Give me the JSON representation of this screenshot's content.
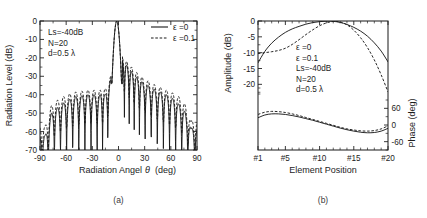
{
  "figure": {
    "background": "#ffffff",
    "ink_color": "#1b1b1b"
  },
  "captions": {
    "left": "(a)",
    "right": "(b)"
  },
  "chart_data": [
    {
      "id": "radiation-pattern",
      "type": "line",
      "title": "",
      "caption": "(a)",
      "xlabel_parts": {
        "main": "Radiation Angel",
        "symbol": "θ",
        "unit": "(deg)"
      },
      "xlabel": "Radiation Angel θ (deg)",
      "ylabel": "Radiation Level (dB)",
      "xlim": [
        -90,
        90
      ],
      "ylim": [
        -70,
        0
      ],
      "xticks": [
        -90,
        -60,
        -30,
        0,
        30,
        60,
        90
      ],
      "xtick_labels": [
        "-90",
        "-60",
        "-30",
        "0",
        "30",
        "60",
        "90"
      ],
      "yticks": [
        0,
        -10,
        -20,
        -30,
        -40,
        -50,
        -60,
        -70
      ],
      "ytick_labels": [
        "0",
        "-10",
        "-20",
        "-30",
        "-40",
        "-50",
        "-60",
        "-70"
      ],
      "grid": false,
      "annotations": [
        "Ls=-40dB",
        "N=20",
        "d=0.5 λ"
      ],
      "legend_position": "top-right",
      "legend": [
        {
          "label": "ε =0",
          "style": "solid"
        },
        {
          "label": "ε =0.1",
          "style": "dashed"
        }
      ],
      "series": [
        {
          "name": "ε =0",
          "style": "solid",
          "comment": "sidelobe envelope values at lobe peaks, nulls reach floor",
          "peaks_x": [
            -84,
            -77,
            -70,
            -63,
            -56,
            -49,
            -42,
            -35,
            -28,
            -21,
            -15.5,
            -9,
            4,
            9.5,
            15,
            21,
            27,
            34,
            41,
            48,
            55,
            62,
            69,
            76,
            83
          ],
          "peaks_y": [
            -62,
            -50,
            -47,
            -44.5,
            -42.5,
            -41,
            -40.5,
            -40,
            -40,
            -40,
            -40,
            -32,
            -20.5,
            -24,
            -27.5,
            -30.5,
            -33,
            -35,
            -37,
            -38.5,
            -40,
            -42,
            -45,
            -49,
            -58
          ],
          "nulls_y": -70,
          "mainlobe": {
            "peak_x": -2.0,
            "peak_y": 0,
            "half_width_deg": 5.6,
            "left_shoulder_x": -10.5,
            "right_shoulder_x": 2.2
          }
        },
        {
          "name": "ε =0.1",
          "style": "dashed",
          "comment": "perturbed pattern: sidelobe floor raised and nulls filled",
          "peaks_x": [
            -84,
            -77,
            -70,
            -63,
            -56,
            -49,
            -42,
            -35,
            -28,
            -21,
            -15.5,
            -9,
            4,
            9.5,
            15,
            21,
            27,
            34,
            41,
            48,
            55,
            62,
            69,
            76,
            83
          ],
          "peaks_y": [
            -57,
            -46,
            -43,
            -41,
            -39.5,
            -38.5,
            -38,
            -37.5,
            -37.5,
            -37.5,
            -37,
            -30,
            -18.5,
            -22,
            -25,
            -28,
            -30.5,
            -32.5,
            -34.5,
            -36,
            -37.5,
            -39,
            -41,
            -45,
            -54
          ],
          "null_fill_offset_db": 12,
          "mainlobe": {
            "peak_x": -2.0,
            "peak_y": 0
          }
        }
      ]
    },
    {
      "id": "element-excitation",
      "type": "line",
      "title": "",
      "caption": "(b)",
      "xlabel": "Element Position",
      "ylabel_left": "Amplitude (dB)",
      "ylabel_right": "Phase (deg)",
      "xlim": [
        1,
        20
      ],
      "xticks": [
        1,
        5,
        10,
        15,
        20
      ],
      "xtick_labels": [
        "#1",
        "#5",
        "#10",
        "#15",
        "#20"
      ],
      "xminor_ticks": [
        2,
        3,
        4,
        6,
        7,
        8,
        9,
        11,
        12,
        13,
        14,
        16,
        17,
        18,
        19
      ],
      "amplitude_ylim": [
        -24,
        0
      ],
      "amplitude_yticks": [
        0,
        -5,
        -10,
        -15,
        -20
      ],
      "amplitude_ytick_labels": [
        "0",
        "-5",
        "-10",
        "-15",
        "-20"
      ],
      "phase_ylim": [
        -90,
        90
      ],
      "phase_yticks": [
        60,
        0,
        -60
      ],
      "phase_ytick_labels": [
        "60",
        "0",
        "-60"
      ],
      "grid": false,
      "annotations": [
        "ε =0",
        "ε =0.1",
        "Ls=-40dB",
        "N=20",
        "d=0.5 λ"
      ],
      "series": [
        {
          "name": "amplitude ε =0",
          "panel": "amplitude",
          "style": "solid",
          "x": [
            1,
            2,
            3,
            4,
            5,
            6,
            7,
            8,
            9,
            10,
            11,
            12,
            13,
            14,
            15,
            16,
            17,
            18,
            19,
            20
          ],
          "values": [
            -13.2,
            -9.6,
            -7.0,
            -5.1,
            -3.6,
            -2.5,
            -1.7,
            -1.0,
            -0.5,
            -0.2,
            -0.05,
            -0.1,
            -0.45,
            -1.1,
            -2.0,
            -3.2,
            -4.8,
            -6.9,
            -9.5,
            -12.9
          ]
        },
        {
          "name": "amplitude ε =0.1",
          "panel": "amplitude",
          "style": "dashed",
          "x": [
            1,
            2,
            3,
            4,
            5,
            6,
            7,
            8,
            9,
            10,
            11,
            12,
            13,
            14,
            15,
            16,
            17,
            18,
            19,
            20
          ],
          "values": [
            -10.3,
            -10.0,
            -9.7,
            -9.3,
            -8.6,
            -7.4,
            -5.9,
            -4.3,
            -2.8,
            -1.5,
            -0.6,
            -0.15,
            -0.3,
            -1.2,
            -2.9,
            -5.3,
            -8.4,
            -12.3,
            -17.0,
            -22.4
          ]
        },
        {
          "name": "phase ε =0",
          "panel": "phase",
          "style": "solid",
          "x": [
            1,
            2,
            3,
            4,
            5,
            6,
            7,
            8,
            9,
            10,
            11,
            12,
            13,
            14,
            15,
            16,
            17,
            18,
            19,
            20
          ],
          "values": [
            26,
            36,
            40,
            40,
            38,
            34,
            29,
            23,
            17,
            10,
            3,
            -4,
            -11,
            -17,
            -22,
            -26,
            -28,
            -27,
            -22,
            -12
          ]
        },
        {
          "name": "phase ε =0.1",
          "panel": "phase",
          "style": "dashed",
          "x": [
            1,
            2,
            3,
            4,
            5,
            6,
            7,
            8,
            9,
            10,
            11,
            12,
            13,
            14,
            15,
            16,
            17,
            18,
            19,
            20
          ],
          "values": [
            38,
            46,
            49,
            48,
            45,
            40,
            34,
            27,
            20,
            13,
            6,
            -1,
            -8,
            -14,
            -18,
            -21,
            -22,
            -20,
            -14,
            -3
          ]
        }
      ]
    }
  ]
}
